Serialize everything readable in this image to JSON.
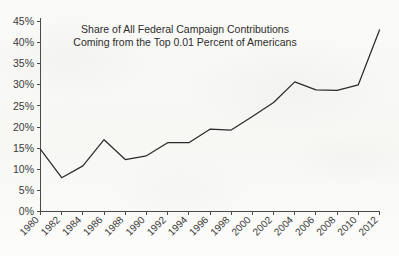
{
  "chart_data": {
    "type": "line",
    "title_lines": [
      "Share of All Federal Campaign Contributions",
      "Coming from the Top 0.01 Percent of Americans"
    ],
    "xlabel": "",
    "ylabel": "",
    "categories": [
      "1980",
      "1982",
      "1984",
      "1986",
      "1988",
      "1990",
      "1992",
      "1994",
      "1996",
      "1998",
      "2000",
      "2002",
      "2004",
      "2006",
      "2008",
      "2010",
      "2012"
    ],
    "values": [
      14.7,
      8.0,
      10.8,
      17.0,
      12.3,
      13.2,
      16.3,
      16.3,
      19.5,
      19.3,
      22.5,
      25.8,
      30.7,
      28.8,
      28.7,
      30.0,
      43.0
    ],
    "series": [
      {
        "name": "Share of federal campaign contributions from top 0.01%",
        "values": [
          14.7,
          8.0,
          10.8,
          17.0,
          12.3,
          13.2,
          16.3,
          16.3,
          19.5,
          19.3,
          22.5,
          25.8,
          30.7,
          28.8,
          28.7,
          30.0,
          43.0
        ]
      }
    ],
    "ylim": [
      0,
      45
    ],
    "xlim": [
      "1980",
      "2012"
    ],
    "ytick_labels": [
      "0%",
      "5%",
      "10%",
      "15%",
      "20%",
      "25%",
      "30%",
      "35%",
      "40%",
      "45%"
    ],
    "ytick_values": [
      0,
      5,
      10,
      15,
      20,
      25,
      30,
      35,
      40,
      45
    ],
    "xtick_labels": [
      "1980",
      "1982",
      "1984",
      "1986",
      "1988",
      "1990",
      "1992",
      "1994",
      "1996",
      "1998",
      "2000",
      "2002",
      "2004",
      "2006",
      "2008",
      "2010",
      "2012"
    ],
    "xtick_rotation_degrees": -45,
    "grid": false,
    "legend": "none",
    "line_color": "#2b2b2b",
    "axis_color": "#4a4a4a",
    "background_color": "#fbfbf9",
    "value_unit": "percent"
  }
}
